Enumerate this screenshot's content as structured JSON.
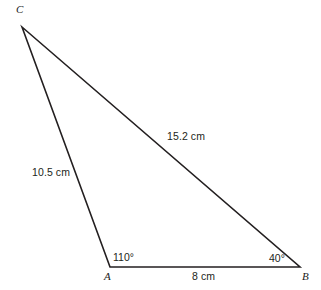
{
  "figure": {
    "type": "triangle-diagram",
    "background_color": "#ffffff",
    "stroke_color": "#231f20",
    "text_color": "#231f20"
  },
  "vertices": {
    "c": {
      "label": "C",
      "x": 22,
      "y": 27
    },
    "a": {
      "label": "A",
      "x": 110,
      "y": 267
    },
    "b": {
      "label": "B",
      "x": 300,
      "y": 267
    }
  },
  "sides": {
    "ca": {
      "label": "10.5 cm",
      "from": "C",
      "to": "A"
    },
    "cb": {
      "label": "15.2 cm",
      "from": "C",
      "to": "B"
    },
    "ab": {
      "label": "8 cm",
      "from": "A",
      "to": "B"
    }
  },
  "angles": {
    "at_a": {
      "label": "110°",
      "value": 110,
      "vertex": "A",
      "arc_radius": 25
    },
    "at_b": {
      "label": "40°",
      "value": 40,
      "vertex": "B",
      "arc_radius": 28
    }
  },
  "chart_data": {
    "type": "diagram",
    "title": "",
    "shape": "triangle",
    "points": [
      {
        "name": "C",
        "x": 22,
        "y": 27
      },
      {
        "name": "A",
        "x": 110,
        "y": 267
      },
      {
        "name": "B",
        "x": 300,
        "y": 267
      }
    ],
    "edge_labels": [
      "10.5 cm",
      "15.2 cm",
      "8 cm"
    ],
    "angle_labels": [
      "110°",
      "40°"
    ]
  }
}
